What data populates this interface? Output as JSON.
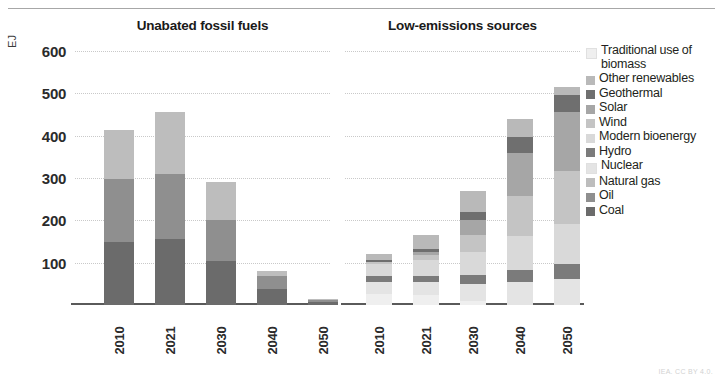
{
  "figure": {
    "unit_label": "EJ",
    "credit": "IEA. CC BY 4.0."
  },
  "legend": {
    "items": [
      {
        "label": "Traditional use of biomass",
        "color": "#efefef"
      },
      {
        "label": "Other renewables",
        "color": "#b9b9b9"
      },
      {
        "label": "Geothermal",
        "color": "#6f6f6f"
      },
      {
        "label": "Solar",
        "color": "#a6a6a6"
      },
      {
        "label": "Wind",
        "color": "#c4c4c4"
      },
      {
        "label": "Modern bioenergy",
        "color": "#d9d9d9"
      },
      {
        "label": "Hydro",
        "color": "#7b7b7b"
      },
      {
        "label": "Nuclear",
        "color": "#e4e4e4"
      },
      {
        "label": "Natural gas",
        "color": "#bdbdbd"
      },
      {
        "label": "Oil",
        "color": "#8f8f8f"
      },
      {
        "label": "Coal",
        "color": "#6b6b6b"
      }
    ]
  },
  "chart_data": {
    "type": "bar",
    "subtype": "stacked",
    "title": "",
    "ylabel": "EJ",
    "xlabel": "",
    "ylim": [
      0,
      600
    ],
    "yticks": [
      100,
      200,
      300,
      400,
      500,
      600
    ],
    "grid": true,
    "legend_position": "right",
    "panels": [
      {
        "title": "Unabated fossil fuels",
        "categories": [
          "2010",
          "2021",
          "2030",
          "2040",
          "2050"
        ],
        "series": [
          {
            "name": "Coal",
            "color": "#6b6b6b",
            "values": [
              150,
              155,
              105,
              38,
              8
            ]
          },
          {
            "name": "Oil",
            "color": "#8f8f8f",
            "values": [
              148,
              155,
              95,
              30,
              5
            ]
          },
          {
            "name": "Natural gas",
            "color": "#bdbdbd",
            "values": [
              115,
              145,
              90,
              12,
              2
            ]
          }
        ],
        "totals": [
          413,
          455,
          290,
          80,
          15
        ]
      },
      {
        "title": "Low-emissions sources",
        "categories": [
          "2010",
          "2021",
          "2030",
          "2040",
          "2050"
        ],
        "series": [
          {
            "name": "Traditional use of biomass",
            "color": "#efefef",
            "values": [
              25,
              24,
              10,
              0,
              0
            ]
          },
          {
            "name": "Nuclear",
            "color": "#e4e4e4",
            "values": [
              30,
              30,
              40,
              55,
              62
            ]
          },
          {
            "name": "Hydro",
            "color": "#7b7b7b",
            "values": [
              13,
              15,
              20,
              28,
              34
            ]
          },
          {
            "name": "Modern bioenergy",
            "color": "#d9d9d9",
            "values": [
              30,
              38,
              55,
              80,
              95
            ]
          },
          {
            "name": "Wind",
            "color": "#c4c4c4",
            "values": [
              3,
              12,
              40,
              95,
              125
            ]
          },
          {
            "name": "Solar",
            "color": "#a6a6a6",
            "values": [
              1,
              6,
              35,
              100,
              140
            ]
          },
          {
            "name": "Geothermal",
            "color": "#6f6f6f",
            "values": [
              5,
              8,
              20,
              40,
              40
            ]
          },
          {
            "name": "Other renewables",
            "color": "#b9b9b9",
            "values": [
              13,
              32,
              50,
              42,
              19
            ]
          }
        ],
        "totals": [
          120,
          165,
          270,
          440,
          515
        ]
      }
    ]
  }
}
